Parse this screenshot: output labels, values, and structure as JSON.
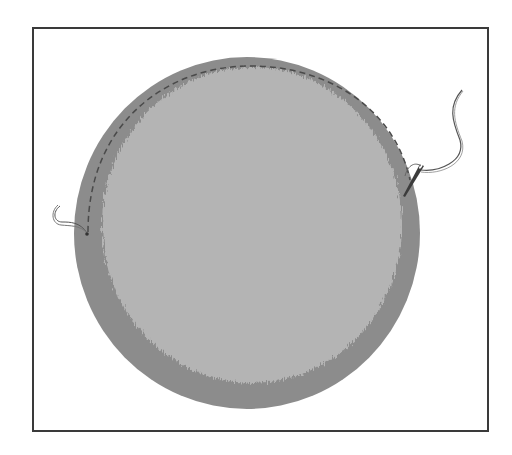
{
  "illustration": {
    "title": "Running stitch along edge of circular fabric with needle and thread",
    "colors": {
      "frame_border": "#3a3a3a",
      "outer_fabric": "#8c8c8c",
      "inner_fabric": "#b4b4b4",
      "stitch_line": "#4a4a4a",
      "thread": "#555555",
      "needle": "#3c3c3c",
      "background": "#ffffff"
    },
    "parts": [
      "frame",
      "fabric-circle",
      "frayed-inner-area",
      "dashed-stitch-line",
      "thread-tail-left",
      "needle",
      "thread-right"
    ]
  }
}
